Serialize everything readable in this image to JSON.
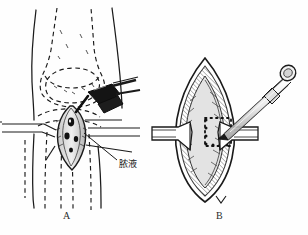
{
  "figure": {
    "background_color": "#fefefe",
    "ink_color": "#1a1a1a",
    "width": 308,
    "height": 235
  },
  "panels": [
    {
      "id": "A",
      "caption": "A",
      "description": "Anterior view of knee with dashed bone outlines, vertical incision opened by retractors, cannula/drain inserted",
      "annotations": [
        {
          "id": "pus",
          "text": "脓液",
          "meaning": "pus",
          "x": 119,
          "y": 157,
          "leader_from": [
            117,
            160
          ],
          "leader_to": [
            84,
            133
          ]
        }
      ]
    },
    {
      "id": "B",
      "caption": "B",
      "description": "Close-up of opened wound held by two retractors, dotted square marking excision area, trocar/syringe entering the wound",
      "annotations": []
    }
  ],
  "elements": {
    "syringe_label": "syringe-cannula",
    "retractor_label": "wound-retractor",
    "bone_outline_label": "dashed-bone-outline",
    "incision_label": "incision-wound",
    "dotted_marking_label": "dotted-excision-outline"
  },
  "colors": {
    "ink": "#1a1a1a",
    "mid_gray": "#6b6b6b",
    "light_gray": "#bdbdbd",
    "shade": "#9a9a9a",
    "paper": "#fefefe"
  }
}
